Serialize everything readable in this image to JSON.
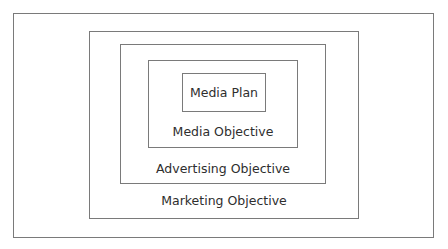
{
  "diagram": {
    "type": "nested-boxes",
    "colors": {
      "border": "#7a7a7a",
      "text": "#2e2e2e",
      "background": "#ffffff"
    },
    "levels": [
      {
        "label": "Marketing Objective",
        "depth": 1
      },
      {
        "label": "Advertising Objective",
        "depth": 2
      },
      {
        "label": "Media Objective",
        "depth": 3
      },
      {
        "label": "Media Plan",
        "depth": 4
      }
    ]
  }
}
